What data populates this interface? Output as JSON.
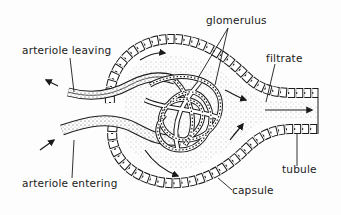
{
  "diagram": {
    "type": "anatomical illustration",
    "colors": {
      "ink": "#1a1a1a",
      "background": "#fdfdfd",
      "stipple": "#444444"
    }
  },
  "labels": {
    "arteriole_leaving": "arteriole leaving",
    "arteriole_entering": "arteriole entering",
    "glomerulus": "glomerulus",
    "filtrate": "filtrate",
    "tubule": "tubule",
    "capsule": "capsule"
  },
  "arrows": [
    {
      "name": "outflow-arrow-leaving",
      "direction": "up-left"
    },
    {
      "name": "inflow-arrow-entering",
      "direction": "up-right"
    },
    {
      "name": "filtrate-flow-arrow",
      "direction": "right"
    }
  ]
}
